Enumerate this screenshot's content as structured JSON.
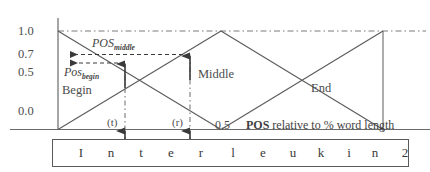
{
  "figure": {
    "y_axis": {
      "ticks": [
        {
          "label": "1.0",
          "value": 1.0
        },
        {
          "label": "0.7",
          "value": 0.7
        },
        {
          "label": "0.5",
          "value": 0.5
        },
        {
          "label": "0.0",
          "value": 0.0
        }
      ]
    },
    "x_axis": {
      "midpoint_label": "0.5",
      "caption_bold": "POS",
      "caption_rest": " relative to % word length"
    },
    "region_labels": {
      "begin": "Begin",
      "middle": "Middle",
      "end": "End"
    },
    "annotations": {
      "pos_middle_base": "POS",
      "pos_middle_sub": "middle",
      "pos_begin_base": "Pos",
      "pos_begin_sub": "begin",
      "marker_t": "(t)",
      "marker_r": "(r)"
    },
    "word_box": {
      "word": "Interleukin 2",
      "chars": [
        {
          "char": "I",
          "x": 28
        },
        {
          "char": "n",
          "x": 58
        },
        {
          "char": "t",
          "x": 88
        },
        {
          "char": "e",
          "x": 118
        },
        {
          "char": "r",
          "x": 148
        },
        {
          "char": "l",
          "x": 180
        },
        {
          "char": "e",
          "x": 210
        },
        {
          "char": "u",
          "x": 240
        },
        {
          "char": "k",
          "x": 268
        },
        {
          "char": "i",
          "x": 296
        },
        {
          "char": "n",
          "x": 322
        },
        {
          "char": "2",
          "x": 352
        }
      ]
    }
  },
  "chart_data": {
    "type": "line",
    "xlabel": "POS relative to % word length",
    "ylabel": "",
    "xlim": [
      0,
      1
    ],
    "ylim": [
      0,
      1
    ],
    "grid": false,
    "legend": "inline-region-labels",
    "x_tick_labels": [
      "0.5"
    ],
    "y_tick_labels": [
      "0.0",
      "0.5",
      "0.7",
      "1.0"
    ],
    "series": [
      {
        "name": "Begin",
        "points": [
          [
            0,
            1.0
          ],
          [
            0.5,
            0.0
          ]
        ]
      },
      {
        "name": "Middle",
        "points": [
          [
            0,
            0.0
          ],
          [
            0.5,
            1.0
          ],
          [
            1.0,
            0.0
          ]
        ]
      },
      {
        "name": "End",
        "points": [
          [
            0.5,
            0.0
          ],
          [
            1.0,
            1.0
          ]
        ]
      }
    ],
    "annotations": [
      {
        "label": "POS middle",
        "type": "horizontal-arrow",
        "y": 0.7,
        "x_from": 0.0,
        "x_to": 0.4
      },
      {
        "label": "Pos begin",
        "type": "horizontal-arrow",
        "y": 0.62,
        "x_from": 0.0,
        "x_to": 0.205
      },
      {
        "label": "(t)",
        "type": "vertical-marker",
        "x": 0.205
      },
      {
        "label": "(r)",
        "type": "vertical-marker",
        "x": 0.4
      }
    ]
  }
}
